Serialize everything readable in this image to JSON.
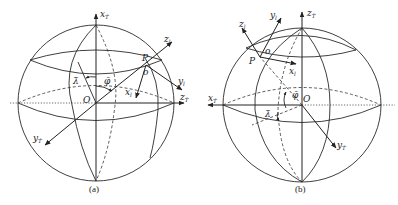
{
  "figure": {
    "panels": [
      {
        "id": "a",
        "caption": "(a)",
        "labels": {
          "x_axis": "x",
          "x_axis_sub": "T̄",
          "y_axis": "y",
          "y_axis_sub": "T̄",
          "z_axis": "z",
          "z_axis_sub": "T̄",
          "local_z": "z",
          "local_z_sub": "l",
          "local_y": "y",
          "local_y_sub": "l",
          "local_x": "x",
          "local_x_sub": "l",
          "point_P": "P",
          "point_o": "o",
          "origin": "O",
          "lambda": "λ̄",
          "phi": "φ̄"
        }
      },
      {
        "id": "b",
        "caption": "(b)",
        "labels": {
          "x_axis": "x",
          "x_axis_sub": "T̄",
          "y_axis": "y",
          "y_axis_sub": "T̄",
          "z_axis": "z",
          "z_axis_sub": "T̄",
          "local_z": "z",
          "local_z_sub": "l",
          "local_y": "y",
          "local_y_sub": "l",
          "local_x": "x",
          "local_x_sub": "l",
          "point_P": "P",
          "point_o": "o",
          "origin": "O",
          "lambda": "λ̄",
          "phi": "φ̄"
        }
      }
    ]
  }
}
